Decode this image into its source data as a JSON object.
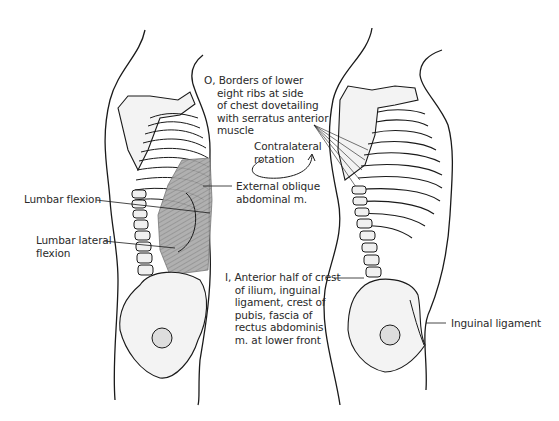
{
  "figure": {
    "colors": {
      "outline": "#1a1a1a",
      "bone_fill": "#f2f2f2",
      "muscle_fill": "#9a9a9a",
      "text": "#2a2a2a"
    }
  },
  "left_figure": {
    "labels": {
      "lumbar_flexion": "Lumbar flexion",
      "lumbar_lateral_flexion": "Lumbar lateral\nflexion",
      "external_oblique": "External oblique\nabdominal m."
    }
  },
  "center_labels": {
    "origin": "O, Borders of lower\n    eight ribs at side\n    of chest dovetailing\n    with serratus anterior\n    muscle",
    "contralateral_rotation": "Contralateral\nrotation",
    "insertion": "I, Anterior half of crest\n   of ilium, inguinal\n   ligament, crest of\n   pubis, fascia of\n   rectus abdominis\n   m. at lower front"
  },
  "right_figure": {
    "labels": {
      "inguinal_ligament": "Inguinal ligament"
    }
  }
}
